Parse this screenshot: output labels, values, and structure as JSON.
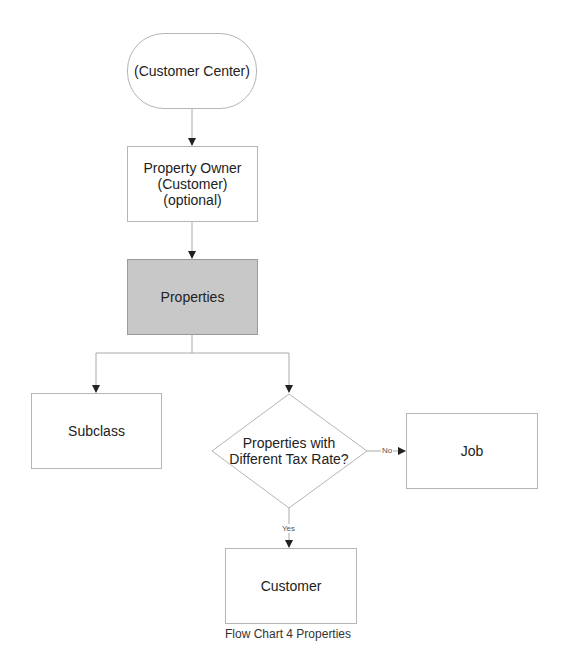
{
  "diagram": {
    "nodes": {
      "start": {
        "label": "(Customer Center)",
        "shape": "terminal"
      },
      "owner": {
        "lines": [
          "Property Owner",
          "(Customer)",
          "(optional)"
        ],
        "shape": "process"
      },
      "properties": {
        "label": "Properties",
        "shape": "process",
        "fill": "#c8c8c8"
      },
      "subclass": {
        "label": "Subclass",
        "shape": "process"
      },
      "decision": {
        "lines": [
          "Properties with",
          "Different Tax Rate?"
        ],
        "shape": "decision"
      },
      "job": {
        "label": "Job",
        "shape": "process"
      },
      "customer": {
        "label": "Customer",
        "shape": "process"
      }
    },
    "edges": {
      "no_label": "No",
      "yes_label": "Yes"
    },
    "caption": "Flow Chart 4 Properties",
    "colors": {
      "stroke": "#b5b5b5",
      "arrow": "#222222",
      "highlight_fill": "#c8c8c8"
    }
  }
}
